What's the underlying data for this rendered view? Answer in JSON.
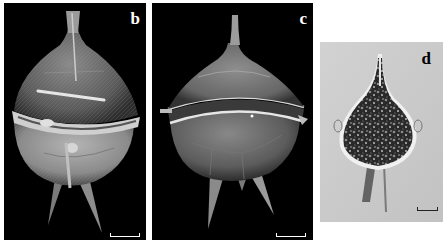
{
  "figure": {
    "panels": [
      {
        "id": "b",
        "label": "b",
        "type": "SEM micrograph",
        "background": "#000000",
        "label_color": "#ffffff",
        "scale_bar_color": "#ffffff"
      },
      {
        "id": "c",
        "label": "c",
        "type": "SEM micrograph",
        "background": "#000000",
        "label_color": "#ffffff",
        "scale_bar_color": "#ffffff"
      },
      {
        "id": "d",
        "label": "d",
        "type": "Light micrograph",
        "background": "#c9c9c9",
        "label_color": "#000000",
        "scale_bar_color": "#222222"
      }
    ]
  }
}
